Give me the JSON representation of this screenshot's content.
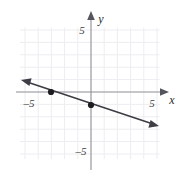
{
  "figure": {
    "name": "coordinate-plane-line-graph",
    "background_color": "#ffffff",
    "width": 185,
    "height": 179
  },
  "axes": {
    "x_axis_label": "x",
    "y_axis_label": "y",
    "x_ticks": [
      {
        "value": -5,
        "label": "–5"
      },
      {
        "value": 5,
        "label": "5"
      }
    ],
    "y_ticks": [
      {
        "value": 5,
        "label": "5"
      },
      {
        "value": -5,
        "label": "–5"
      }
    ],
    "axis_color": "#8e8e96",
    "grid_color": "#ededf1",
    "grid_visible": true,
    "arrowheads": "both-ends-positive-direction"
  },
  "chart_data": {
    "type": "line",
    "title": "",
    "xlabel": "x",
    "ylabel": "y",
    "xlim": [
      -6,
      6
    ],
    "ylim": [
      -6,
      6
    ],
    "grid": true,
    "legend": "none",
    "series": [
      {
        "name": "line",
        "color": "#3d3d45",
        "slope": -0.3333,
        "intercept": -1,
        "equation": "y = -1/3 x - 1",
        "x": [
          -5.6,
          4.6
        ],
        "y": [
          0.867,
          -2.533
        ],
        "arrow_start": true,
        "arrow_end": true
      }
    ],
    "points": [
      {
        "label": "x-intercept",
        "x": -3,
        "y": 0
      },
      {
        "label": "y-intercept",
        "x": 0,
        "y": -1
      }
    ],
    "point_color": "#1d1d22",
    "point_radius": 3
  }
}
